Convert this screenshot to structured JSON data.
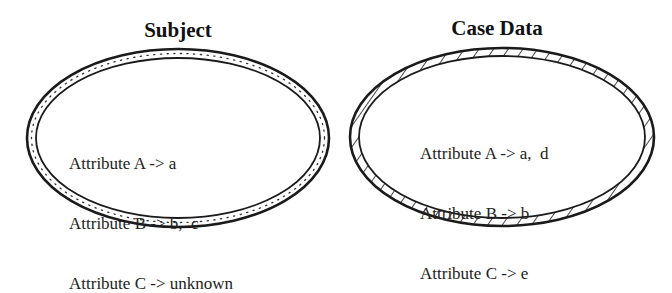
{
  "diagram": {
    "subject": {
      "title": "Subject",
      "border_style": "dotted",
      "attributes": [
        "Attribute A -> a",
        "Attribute B -> b,  c",
        "Attribute C -> unknown"
      ]
    },
    "case_data": {
      "title": "Case Data",
      "border_style": "hatched",
      "attributes": [
        "Attribute A -> a,  d",
        "Attribute B -> b",
        "Attribute C -> e"
      ]
    },
    "colors": {
      "stroke": "#1a1a1a",
      "background": "#ffffff"
    }
  }
}
